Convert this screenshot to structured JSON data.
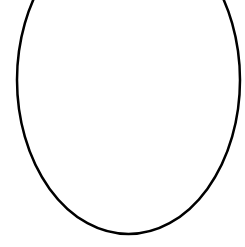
{
  "canvas": {
    "width": 245,
    "height": 247,
    "background": "#ffffff"
  },
  "shape": {
    "type": "ellipse",
    "cx": 128.5,
    "cy": 80,
    "rx": 111.5,
    "ry": 154,
    "stroke": "#000000",
    "stroke_width": 2.5,
    "fill": "none"
  }
}
